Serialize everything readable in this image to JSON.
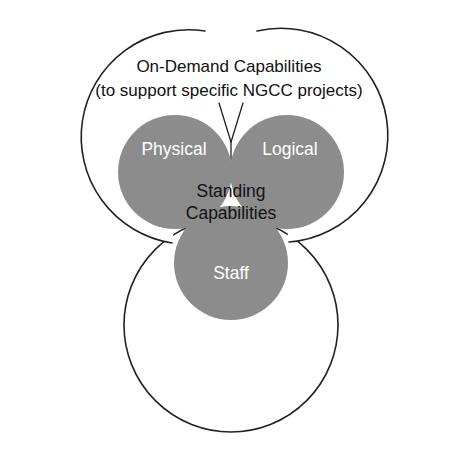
{
  "diagram": {
    "kind": "venn-trefoil-diagram",
    "background_color": "#ffffff",
    "title": {
      "line1": "On-Demand Capabilities",
      "line2": "(to support specific NGCC projects)"
    },
    "center": {
      "line1": "Standing",
      "line2": "Capabilities"
    },
    "lobes": [
      {
        "id": "physical",
        "label": "Physical",
        "fill": "#8c8c8c",
        "text_color": "#ffffff"
      },
      {
        "id": "logical",
        "label": "Logical",
        "fill": "#8c8c8c",
        "text_color": "#ffffff"
      },
      {
        "id": "staff",
        "label": "Staff",
        "fill": "#8c8c8c",
        "text_color": "#ffffff"
      }
    ],
    "outer_circles": [
      {
        "id": "outer-top-left",
        "style": "arc",
        "stroke": "#222222",
        "fill": "#ffffff"
      },
      {
        "id": "outer-top-right",
        "style": "arc",
        "stroke": "#222222",
        "fill": "#ffffff"
      },
      {
        "id": "outer-bottom",
        "style": "circle",
        "stroke": "#222222",
        "fill": "#ffffff"
      }
    ],
    "leader_line": {
      "id": "title-leader-line",
      "shape": "v-pointer",
      "stroke": "#222222"
    }
  }
}
